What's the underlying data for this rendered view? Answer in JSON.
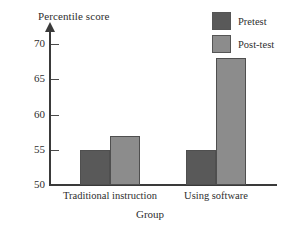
{
  "chart_data": {
    "type": "bar",
    "title": "",
    "xlabel": "Group",
    "ylabel": "Percentile score",
    "categories": [
      "Traditional instruction",
      "Using software"
    ],
    "series": [
      {
        "name": "Pretest",
        "values": [
          55,
          55
        ],
        "color": "#595959"
      },
      {
        "name": "Post-test",
        "values": [
          57,
          68
        ],
        "color": "#8c8c8c"
      }
    ],
    "ylim": [
      50,
      72
    ],
    "yticks": [
      50,
      55,
      60,
      65,
      70
    ],
    "ytick_labels": [
      "50",
      "55",
      "60",
      "65",
      "70"
    ],
    "grid": false,
    "legend_position": "top-right",
    "axis_arrow": "up"
  },
  "axis": {
    "y_title": "Percentile score",
    "x_title": "Group",
    "ticks": [
      {
        "label": "70",
        "value": 70
      },
      {
        "label": "65",
        "value": 65
      },
      {
        "label": "60",
        "value": 60
      },
      {
        "label": "55",
        "value": 55
      },
      {
        "label": "50",
        "value": 50
      }
    ]
  },
  "categories": [
    {
      "label": "Traditional instruction"
    },
    {
      "label": "Using software"
    }
  ],
  "legend": {
    "items": [
      {
        "label": "Pretest",
        "color": "#595959"
      },
      {
        "label": "Post-test",
        "color": "#8c8c8c"
      }
    ]
  }
}
